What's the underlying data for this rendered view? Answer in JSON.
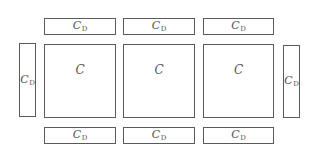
{
  "diagram": {
    "center_label": "C",
    "edge_label": {
      "main": "C",
      "sub": "D"
    },
    "colors": {
      "stroke": "#5a5a5a",
      "text": "#555555",
      "background": "#ffffff"
    },
    "top_row": [
      {
        "main": "C",
        "sub": "D"
      },
      {
        "main": "C",
        "sub": "D"
      },
      {
        "main": "C",
        "sub": "D"
      }
    ],
    "middle_row": {
      "left": {
        "main": "C",
        "sub": "D"
      },
      "squares": [
        {
          "label": "C"
        },
        {
          "label": "C"
        },
        {
          "label": "C"
        }
      ],
      "right": {
        "main": "C",
        "sub": "D"
      }
    },
    "bottom_row": [
      {
        "main": "C",
        "sub": "D"
      },
      {
        "main": "C",
        "sub": "D"
      },
      {
        "main": "C",
        "sub": "D"
      }
    ]
  }
}
